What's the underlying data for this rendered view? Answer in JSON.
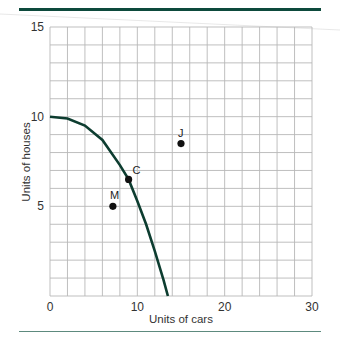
{
  "chart_data": {
    "type": "line",
    "title": "",
    "xlabel": "Units of cars",
    "ylabel": "Units of houses",
    "xlim": [
      0,
      30
    ],
    "ylim": [
      0,
      15
    ],
    "x_ticks": [
      "0",
      "10",
      "20",
      "30"
    ],
    "y_ticks": [
      "5",
      "10",
      "15"
    ],
    "grid": true,
    "grid_x_step": 2,
    "grid_y_step": 1,
    "series": [
      {
        "name": "Production possibilities frontier",
        "x": [
          0,
          2,
          4,
          6,
          8,
          9,
          10,
          11,
          12,
          13,
          13.5
        ],
        "y": [
          10,
          9.9,
          9.5,
          8.7,
          7.3,
          6.5,
          5.3,
          4.0,
          2.5,
          0.9,
          0
        ]
      }
    ],
    "points": [
      {
        "label": "C",
        "x": 9,
        "y": 6.5
      },
      {
        "label": "M",
        "x": 7.2,
        "y": 5
      },
      {
        "label": "J",
        "x": 15,
        "y": 8.5
      }
    ],
    "colors": {
      "curve": "#0d3d30",
      "rule": "#0d4a3c",
      "grid": "#b8b8b8",
      "point": "#111111"
    }
  }
}
